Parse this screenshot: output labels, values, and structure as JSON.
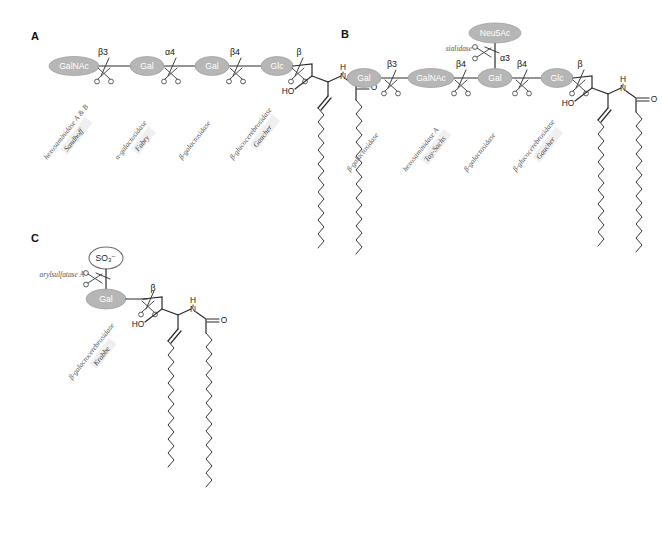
{
  "figure": {
    "background_color": "#ffffff",
    "sugar_fill_color": "#b6b6b6",
    "sugar_text_color": "#ffffff",
    "open_oval_fill": "#ffffff",
    "bond_color": "#2b2b2b",
    "enzyme_label_color": "#555555"
  },
  "panels": [
    {
      "id": "A",
      "letter": "A",
      "molecule": "globoside / GbO4 (ceramide tetrasaccharide)",
      "sugars": [
        {
          "name": "GalNAc"
        },
        {
          "name": "Gal"
        },
        {
          "name": "Gal"
        },
        {
          "name": "Glc"
        }
      ],
      "linkages": [
        "β3",
        "α4",
        "β4",
        "β"
      ],
      "cleavages": [
        {
          "enzyme": "hexosaminidase A & B",
          "disease": "Sandhoff"
        },
        {
          "enzyme": "α-galactosidase",
          "disease": "Fabry"
        },
        {
          "enzyme": "β-galactosidase",
          "disease": ""
        },
        {
          "enzyme": "β-glucocerebrosidase",
          "disease": "Gaucher"
        }
      ],
      "ceramide": {
        "hydroxyl": "HO",
        "amide_n": "N",
        "amide_h": "H",
        "carbonyl_o": "O"
      }
    },
    {
      "id": "B",
      "letter": "B",
      "molecule": "GM1 ganglioside",
      "sugars": [
        {
          "name": "Gal"
        },
        {
          "name": "GalNAc"
        },
        {
          "name": "Gal"
        },
        {
          "name": "Glc"
        }
      ],
      "branch": {
        "name": "Neu5Ac",
        "linkage": "α3",
        "enzyme": "sialidase"
      },
      "linkages": [
        "β3",
        "β4",
        "β4",
        "β"
      ],
      "cleavages": [
        {
          "enzyme": "β-galactosidase",
          "disease": ""
        },
        {
          "enzyme": "hexosaminidase A",
          "disease": "Tay-Sachs"
        },
        {
          "enzyme": "β-galactosidase",
          "disease": ""
        },
        {
          "enzyme": "β-glucocerebrosidase",
          "disease": "Gaucher"
        }
      ],
      "ceramide": {
        "hydroxyl": "HO",
        "amide_n": "N",
        "amide_h": "H",
        "carbonyl_o": "O"
      }
    },
    {
      "id": "C",
      "letter": "C",
      "molecule": "sulfatide (galactosylceramide sulfate)",
      "sugars": [
        {
          "name": "Gal"
        }
      ],
      "modification": {
        "name": "SO₃⁻",
        "enzyme": "arylsulfatase A"
      },
      "linkages": [
        "β"
      ],
      "cleavages": [
        {
          "enzyme": "β-galactocerebrosidase",
          "disease": "Krabbe"
        }
      ],
      "ceramide": {
        "hydroxyl": "HO",
        "amide_n": "N",
        "amide_h": "H",
        "carbonyl_o": "O"
      }
    }
  ]
}
